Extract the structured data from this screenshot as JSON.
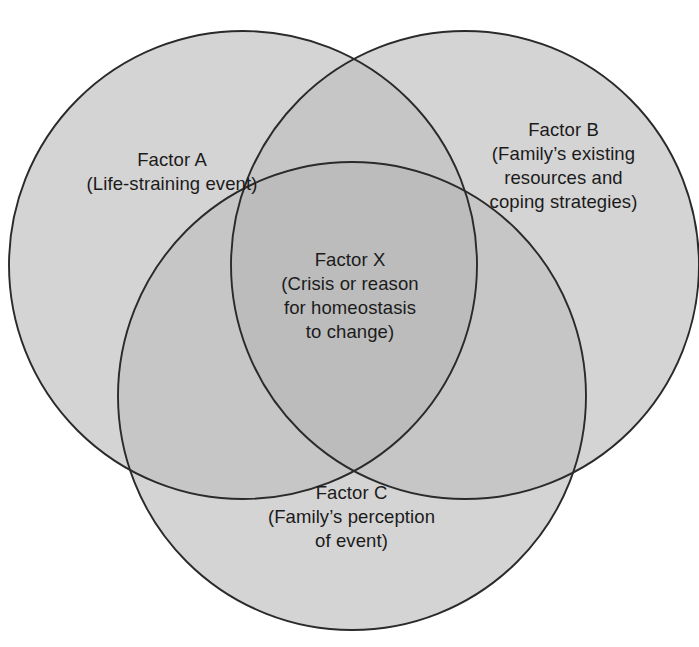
{
  "diagram": {
    "type": "venn-3-circle",
    "background_color": "#ffffff",
    "stroke_color": "#2a2a2a",
    "fill_single": "#d4d4d4",
    "fill_double": "#c6c6c6",
    "fill_triple": "#bcbcbc",
    "text_color": "#1b1b1b"
  },
  "circles": {
    "a": {
      "id": "circle-a",
      "cx": 243,
      "cy": 265,
      "r": 234
    },
    "b": {
      "id": "circle-b",
      "cx": 465,
      "cy": 265,
      "r": 234
    },
    "c": {
      "id": "circle-c",
      "cx": 352,
      "cy": 396,
      "r": 234
    }
  },
  "labels": {
    "factor_a": {
      "lines": [
        "Factor A",
        "(Life-straining event)"
      ]
    },
    "factor_b": {
      "lines": [
        "Factor B",
        "(Family’s existing",
        "resources and",
        "coping strategies)"
      ]
    },
    "factor_x": {
      "lines": [
        "Factor X",
        "(Crisis or reason",
        "for homeostasis",
        "to change)"
      ]
    },
    "factor_c": {
      "lines": [
        "Factor C",
        "(Family’s perception",
        "of event)"
      ]
    }
  }
}
